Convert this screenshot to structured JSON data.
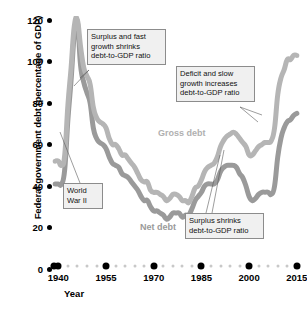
{
  "chart_data": {
    "type": "line",
    "title": "",
    "xlabel": "Year",
    "ylabel": "Federal government debt (percentage of GDP)",
    "xlim": [
      1938,
      2016
    ],
    "ylim": [
      0,
      122
    ],
    "grid": false,
    "legend_position": "inline-on-curves",
    "y_ticks": [
      0,
      20,
      40,
      60,
      80,
      100,
      120
    ],
    "y_tick_labels": [
      "0",
      "20",
      "40",
      "60",
      "80",
      "100",
      "120"
    ],
    "x_ticks": [
      1940,
      1955,
      1970,
      1985,
      2000,
      2015
    ],
    "x_tick_labels": [
      "1940",
      "1955",
      "1970",
      "1985",
      "2000",
      "2015"
    ],
    "x_minor_ticks": [
      1938,
      1943,
      1946,
      1949,
      1952,
      1958,
      1961,
      1964,
      1967,
      1973,
      1976,
      1979,
      1982,
      1988,
      1991,
      1994,
      1997,
      2003,
      2006,
      2009,
      2012
    ],
    "series": [
      {
        "name": "Gross debt",
        "color": "#b5b5b5",
        "label_color": "#b0b0b0",
        "x": [
          1939,
          1940,
          1941,
          1942,
          1943,
          1944,
          1945,
          1946,
          1947,
          1948,
          1949,
          1950,
          1951,
          1952,
          1953,
          1954,
          1955,
          1956,
          1957,
          1958,
          1959,
          1960,
          1961,
          1962,
          1963,
          1964,
          1965,
          1966,
          1967,
          1968,
          1969,
          1970,
          1971,
          1972,
          1973,
          1974,
          1975,
          1976,
          1977,
          1978,
          1979,
          1980,
          1981,
          1982,
          1983,
          1984,
          1985,
          1986,
          1987,
          1988,
          1989,
          1990,
          1991,
          1992,
          1993,
          1994,
          1995,
          1996,
          1997,
          1998,
          1999,
          2000,
          2001,
          2002,
          2003,
          2004,
          2005,
          2006,
          2007,
          2008,
          2009,
          2010,
          2011,
          2012,
          2013,
          2014,
          2015
        ],
        "values": [
          52,
          52,
          50,
          55,
          79,
          97,
          117,
          120,
          107,
          97,
          93,
          89,
          78,
          73,
          71,
          70,
          68,
          63,
          60,
          60,
          58,
          55,
          55,
          53,
          51,
          49,
          46,
          43,
          42,
          42,
          38,
          37,
          37,
          36,
          35,
          33,
          34,
          36,
          36,
          35,
          33,
          33,
          32,
          35,
          39,
          40,
          43,
          47,
          49,
          50,
          51,
          54,
          59,
          62,
          64,
          65,
          66,
          65,
          63,
          61,
          59,
          55,
          55,
          57,
          59,
          60,
          61,
          61,
          62,
          68,
          84,
          92,
          96,
          101,
          101,
          103,
          103
        ]
      },
      {
        "name": "Net debt",
        "color": "#9a9a9a",
        "label_color": "#9a9a9a",
        "x": [
          1939,
          1940,
          1941,
          1942,
          1943,
          1944,
          1945,
          1946,
          1947,
          1948,
          1949,
          1950,
          1951,
          1952,
          1953,
          1954,
          1955,
          1956,
          1957,
          1958,
          1959,
          1960,
          1961,
          1962,
          1963,
          1964,
          1965,
          1966,
          1967,
          1968,
          1969,
          1970,
          1971,
          1972,
          1973,
          1974,
          1975,
          1976,
          1977,
          1978,
          1979,
          1980,
          1981,
          1982,
          1983,
          1984,
          1985,
          1986,
          1987,
          1988,
          1989,
          1990,
          1991,
          1992,
          1993,
          1994,
          1995,
          1996,
          1997,
          1998,
          1999,
          2000,
          2001,
          2002,
          2003,
          2004,
          2005,
          2006,
          2007,
          2008,
          2009,
          2010,
          2011,
          2012,
          2013,
          2014,
          2015
        ],
        "values": [
          41,
          41,
          41,
          48,
          72,
          91,
          113,
          119,
          98,
          90,
          85,
          80,
          68,
          63,
          61,
          60,
          58,
          54,
          51,
          50,
          49,
          46,
          45,
          44,
          42,
          40,
          38,
          35,
          33,
          33,
          30,
          28,
          28,
          27,
          26,
          24,
          25,
          27,
          27,
          27,
          25,
          26,
          26,
          29,
          33,
          35,
          37,
          40,
          41,
          41,
          41,
          43,
          47,
          49,
          50,
          50,
          50,
          49,
          46,
          44,
          40,
          35,
          33,
          34,
          36,
          37,
          37,
          37,
          36,
          40,
          54,
          63,
          68,
          71,
          72,
          74,
          75
        ]
      }
    ],
    "annotations": [
      {
        "id": "ww2",
        "text": "World\nWar II",
        "target_year": 1944,
        "target_value": 60
      },
      {
        "id": "surplus-fast-growth",
        "text": "Surplus and fast\ngrowth shrinks\ndebt-to-GDP ratio",
        "target_year": 1951,
        "target_value": 85
      },
      {
        "id": "deficit-slow-growth",
        "text": "Deficit and slow\ngrowth increases\ndebt-to-GDP ratio",
        "target_year": 2009,
        "target_value": 80
      },
      {
        "id": "surplus-shrinks",
        "text": "Surplus shrinks\ndebt-to-GDP ratio",
        "target_year": 1999,
        "target_value": 45
      }
    ]
  },
  "axis": {
    "y_title": "Federal government debt (percentage of GDP)",
    "x_title": "Year"
  }
}
